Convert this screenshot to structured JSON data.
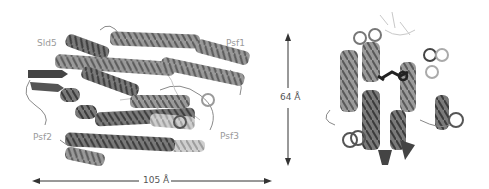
{
  "figure": {
    "left_view": {
      "subunit_labels": [
        "Sld5",
        "Psf1",
        "Psf2",
        "Psf3"
      ]
    },
    "dimensions": {
      "width_label": "105 Å",
      "height_label": "64 Å"
    },
    "right_view": {
      "description": "rotated view of complex"
    }
  }
}
